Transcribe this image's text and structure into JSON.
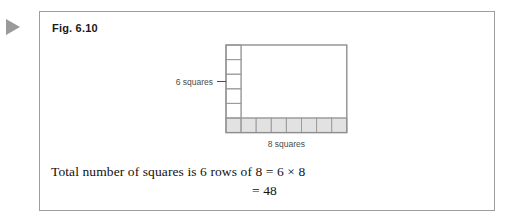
{
  "marker": {
    "icon": "play-triangle-icon"
  },
  "figure": {
    "caption": "Fig. 6.10"
  },
  "diagram": {
    "type": "array-grid",
    "rows": 6,
    "cols": 8,
    "row_label": "6 squares",
    "col_label": "8 squares",
    "shaded_row": "bottom",
    "shaded_fill": "#e2e2e2",
    "grid_line_color": "#9c9c9c",
    "outline_color": "#8f8f8f",
    "label_color": "#4d4d4d",
    "geometry": {
      "left": 186,
      "top": 33,
      "cell_width": 15.1,
      "cell_height": 14.6
    }
  },
  "statement": {
    "line1": "Total number of squares is 6 rows of 8 = 6 × 8",
    "line2": "= 48"
  },
  "chart_data": {
    "type": "table",
    "title": "Fig. 6.10",
    "rows": 6,
    "cols": 8,
    "row_label": "6 squares",
    "col_label": "8 squares",
    "total": 48,
    "expression": "6 × 8 = 48"
  }
}
